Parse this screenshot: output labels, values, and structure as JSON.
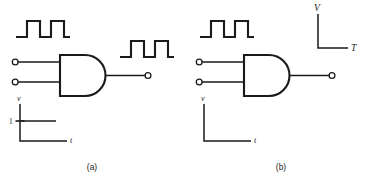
{
  "figure": {
    "title_present": false,
    "background_color": "#ffffff",
    "ink_color": "#1a1a1a",
    "panels": [
      {
        "id": "panel-a",
        "caption": "(a)",
        "gate": {
          "type": "AND",
          "inputs": 2,
          "output_terminals": 1,
          "input_terminals": 2
        },
        "input_waveform": {
          "present": true,
          "shape": "two-pulse-square",
          "pulses": 2,
          "levels": [
            0,
            1,
            0,
            1,
            0
          ],
          "description": "square wave with two high pulses"
        },
        "output_waveform": {
          "present": true,
          "shape": "two-pulse-square",
          "pulses": 2,
          "levels": [
            0,
            1,
            0,
            1,
            0
          ],
          "description": "square wave with two high pulses"
        },
        "axes": {
          "vertical_label": "v",
          "horizontal_label": "t",
          "tick_label": "1",
          "level_line": true
        }
      },
      {
        "id": "panel-b",
        "caption": "(b)",
        "gate": {
          "type": "AND",
          "inputs": 2,
          "output_terminals": 1,
          "input_terminals": 2
        },
        "input_waveform": {
          "present": true,
          "shape": "two-pulse-square",
          "pulses": 2,
          "levels": [
            0,
            1,
            0,
            1,
            0
          ],
          "description": "square wave with two high pulses"
        },
        "output_waveform": {
          "present": false,
          "shape": "",
          "pulses": 0,
          "levels": [],
          "description": "blank axes only"
        },
        "output_axes": {
          "vertical_label": "V",
          "horizontal_label": "T",
          "tick_label": "",
          "level_line": false
        },
        "axes": {
          "vertical_label": "v",
          "horizontal_label": "t",
          "tick_label": "",
          "level_line": false
        }
      }
    ]
  }
}
